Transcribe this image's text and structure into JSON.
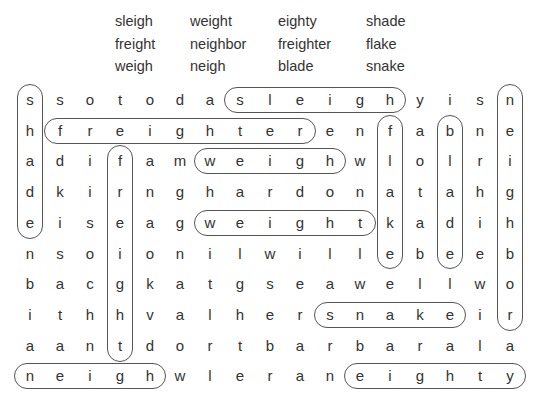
{
  "word_list": {
    "columns": [
      [
        "sleigh",
        "freight",
        "weigh"
      ],
      [
        "weight",
        "neighbor",
        "neigh"
      ],
      [
        "eighty",
        "freighter",
        "blade"
      ],
      [
        "shade",
        "flake",
        "snake"
      ]
    ]
  },
  "grid": {
    "rows": [
      [
        "s",
        "s",
        "o",
        "t",
        "o",
        "d",
        "a",
        "s",
        "l",
        "e",
        "i",
        "g",
        "h",
        "y",
        "i",
        "s",
        "n"
      ],
      [
        "h",
        "f",
        "r",
        "e",
        "i",
        "g",
        "h",
        "t",
        "e",
        "r",
        "e",
        "n",
        "f",
        "a",
        "b",
        "n",
        "e"
      ],
      [
        "a",
        "d",
        "i",
        "f",
        "a",
        "m",
        "w",
        "e",
        "i",
        "g",
        "h",
        "w",
        "l",
        "o",
        "l",
        "r",
        "i"
      ],
      [
        "d",
        "k",
        "i",
        "r",
        "n",
        "g",
        "h",
        "a",
        "r",
        "d",
        "o",
        "n",
        "a",
        "t",
        "a",
        "h",
        "g"
      ],
      [
        "e",
        "i",
        "s",
        "e",
        "a",
        "g",
        "w",
        "e",
        "i",
        "g",
        "h",
        "t",
        "k",
        "a",
        "d",
        "i",
        "h"
      ],
      [
        "n",
        "s",
        "o",
        "i",
        "o",
        "n",
        "i",
        "l",
        "w",
        "i",
        "l",
        "l",
        "e",
        "b",
        "e",
        "e",
        "b"
      ],
      [
        "b",
        "a",
        "c",
        "g",
        "k",
        "a",
        "t",
        "g",
        "s",
        "e",
        "a",
        "w",
        "e",
        "l",
        "l",
        "w",
        "o"
      ],
      [
        "i",
        "t",
        "h",
        "h",
        "v",
        "a",
        "l",
        "h",
        "e",
        "r",
        "s",
        "n",
        "a",
        "k",
        "e",
        "i",
        "r"
      ],
      [
        "a",
        "a",
        "n",
        "t",
        "d",
        "o",
        "r",
        "t",
        "b",
        "a",
        "r",
        "b",
        "a",
        "r",
        "a",
        "l",
        "a"
      ],
      [
        "n",
        "e",
        "i",
        "g",
        "h",
        "w",
        "l",
        "e",
        "r",
        "a",
        "n",
        "e",
        "i",
        "g",
        "h",
        "t",
        "y"
      ]
    ]
  },
  "found_words": [
    {
      "word": "shade",
      "dir": "vertical",
      "row": 0,
      "col": 0,
      "len": 5
    },
    {
      "word": "sleigh",
      "dir": "horizontal",
      "row": 0,
      "col": 7,
      "len": 6
    },
    {
      "word": "neighbor",
      "dir": "vertical",
      "row": 0,
      "col": 16,
      "len": 8
    },
    {
      "word": "freighter",
      "dir": "horizontal",
      "row": 1,
      "col": 1,
      "len": 9
    },
    {
      "word": "flake",
      "dir": "vertical",
      "row": 1,
      "col": 12,
      "len": 5
    },
    {
      "word": "blade",
      "dir": "vertical",
      "row": 1,
      "col": 14,
      "len": 5
    },
    {
      "word": "freight",
      "dir": "vertical",
      "row": 2,
      "col": 3,
      "len": 7
    },
    {
      "word": "weigh",
      "dir": "horizontal",
      "row": 2,
      "col": 6,
      "len": 5
    },
    {
      "word": "weight",
      "dir": "horizontal",
      "row": 4,
      "col": 6,
      "len": 6
    },
    {
      "word": "snake",
      "dir": "horizontal",
      "row": 7,
      "col": 10,
      "len": 5
    },
    {
      "word": "neigh",
      "dir": "horizontal",
      "row": 9,
      "col": 0,
      "len": 5
    },
    {
      "word": "eighty",
      "dir": "horizontal",
      "row": 9,
      "col": 11,
      "len": 6
    }
  ]
}
